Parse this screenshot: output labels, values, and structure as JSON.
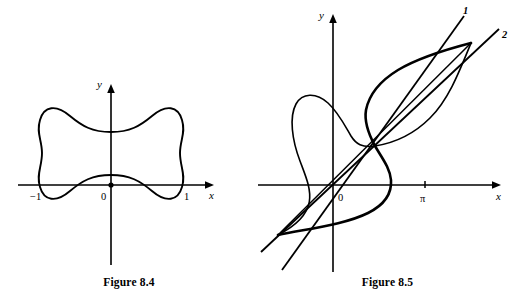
{
  "page": {
    "width": 517,
    "height": 303,
    "background": "#ffffff",
    "ink_color": "#000000"
  },
  "figures": [
    {
      "id": "figure-8-4",
      "caption": "Figure 8.4",
      "axes": {
        "x_label": "x",
        "y_label": "y",
        "origin_label": "0",
        "x_ticks": [
          "−1",
          "1"
        ]
      },
      "curve": {
        "description": "closed quadrifolium-like squircle curve, |x|^(2/3)+|y|^(2/3) style with concave axis crossings at ±1",
        "x_intercepts": [
          -1,
          1
        ],
        "y_intercepts": [
          -1,
          1
        ]
      }
    },
    {
      "id": "figure-8-5",
      "caption": "Figure 8.5",
      "axes": {
        "x_label": "x",
        "y_label": "y",
        "origin_label": "0",
        "x_ticks": [
          "π"
        ]
      },
      "curve_labels": [
        "1",
        "2"
      ],
      "curve": {
        "description": "two curves forming lens/loop shapes crossing at three nodes, with two straight lines labeled 1 and 2 crossing at the upper-right node"
      }
    }
  ]
}
